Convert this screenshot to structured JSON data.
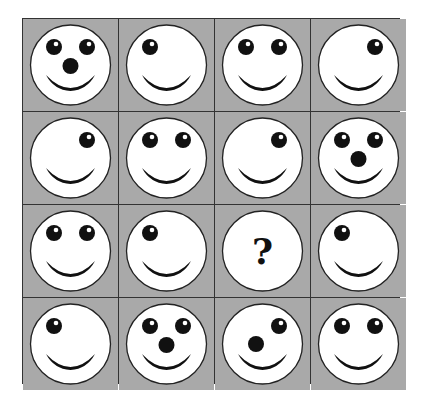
{
  "puzzle": {
    "rows": 4,
    "cols": 4,
    "colors": {
      "background": "#a9a9a9",
      "face": "#ffffff",
      "feature": "#111111",
      "grid_line": "#333333"
    },
    "cells": [
      {
        "eyes": "both",
        "nose": "center"
      },
      {
        "eyes": "left",
        "nose": "none"
      },
      {
        "eyes": "both",
        "nose": "none"
      },
      {
        "eyes": "right",
        "nose": "none"
      },
      {
        "eyes": "right",
        "nose": "none"
      },
      {
        "eyes": "both",
        "nose": "none"
      },
      {
        "eyes": "right",
        "nose": "none"
      },
      {
        "eyes": "both",
        "nose": "center"
      },
      {
        "eyes": "both",
        "nose": "none"
      },
      {
        "eyes": "left",
        "nose": "none"
      },
      {
        "eyes": "unknown",
        "nose": "unknown",
        "label": "?"
      },
      {
        "eyes": "left",
        "nose": "none"
      },
      {
        "eyes": "left",
        "nose": "none"
      },
      {
        "eyes": "both",
        "nose": "center"
      },
      {
        "eyes": "right",
        "nose": "left"
      },
      {
        "eyes": "both",
        "nose": "none"
      }
    ]
  }
}
